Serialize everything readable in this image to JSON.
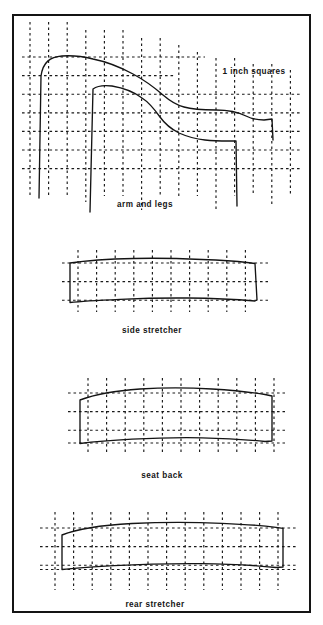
{
  "page": {
    "background_color": "#ffffff",
    "ink_color": "#141414",
    "grid_color": "#1a1a1a",
    "border": {
      "x": 13,
      "y": 15,
      "width": 297,
      "height": 597,
      "stroke_width": 2.0
    },
    "grid_note": "1 inch squares",
    "grid_pitch_px": 18.6
  },
  "figures": [
    {
      "id": "arm-and-legs",
      "caption": "arm and legs",
      "caption_x": 145,
      "caption_y": 205,
      "grid": {
        "x_lines": [
          30,
          48.6,
          67.2,
          85.8,
          104.4,
          123,
          141.6,
          160.2,
          178.8,
          197.4,
          216,
          234.6,
          253.2,
          271.8,
          290.4
        ],
        "y_lines": [
          30,
          48.6,
          67.2,
          85.8,
          104.4,
          123,
          141.6,
          160.2,
          178.8
        ],
        "x_span": [
          22,
          300
        ],
        "y_span": [
          22,
          196
        ]
      },
      "outline_top": "M 39,198 L 41,76 C 43,62 50,57 62,56 C 75,55 85,57 93,59 C 108,62 120,67 133,74 C 146,81 155,88 163,95 C 170,101 176,105 184,107 C 194,110 205,110 216,110 C 228,110 238,112 246,116 C 252,119 258,120 264,120 L 272,119 L 273,140",
      "outline_bottom": "M 90,212 L 93,89 C 97,86 104,85 112,86 C 124,88 134,92 142,98 C 150,103 155,110 160,117 C 165,124 171,129 179,133 C 188,137 196,139 205,140 C 214,141 222,141 229,141 L 236,141 L 237,206"
    },
    {
      "id": "side-stretcher",
      "caption": "side  stretcher",
      "caption_x": 152,
      "caption_y": 331,
      "grid": {
        "x_lines": [
          78,
          96.6,
          115.2,
          133.8,
          152.4,
          171,
          189.6,
          208.2,
          226.8,
          245.4
        ],
        "y_lines": [
          263,
          281.6,
          300.2
        ],
        "x_span": [
          62,
          265
        ],
        "y_span": [
          250,
          312
        ]
      },
      "outline": "M 70,263 C 90,260 112,259 134,258.5 C 156,258 180,258.5 202,259.5 C 220,260.2 234,261 247,262.5 L 255,263.5 L 257,300 L 255,301 C 232,299 210,298.2 188,298 C 165,297.8 142,298.3 120,299.3 C 100,300.2 83,301 70,302.5 Z"
    },
    {
      "id": "seat-back",
      "caption": "seat back",
      "caption_x": 162,
      "caption_y": 476,
      "grid": {
        "x_lines": [
          88,
          106.6,
          125.2,
          143.8,
          162.4,
          181,
          199.6,
          218.2,
          236.8,
          255.4,
          274
        ],
        "y_lines": [
          393,
          411.6,
          430.2
        ],
        "x_span": [
          68,
          285
        ],
        "y_span": [
          378,
          455
        ]
      },
      "outline": "M 80,400 C 96,394 118,390.5 140,389 C 164,387.5 190,387.7 212,389 C 232,390.2 250,392 265,394.5 L 272,396 L 272,441 L 265,441.5 C 246,439.5 225,438.2 202,437.8 C 178,437.4 154,438 132,439.2 C 110,440.4 92,442 80,443.5 Z"
    },
    {
      "id": "rear-stretcher",
      "caption": "rear  stretcher",
      "caption_x": 155,
      "caption_y": 605,
      "grid": {
        "x_lines": [
          55,
          73.6,
          92.2,
          110.8,
          129.4,
          148,
          166.6,
          185.2,
          203.8,
          222.4,
          241,
          259.6,
          278
        ],
        "y_lines": [
          528,
          546.6,
          565.2
        ],
        "x_span": [
          40,
          292
        ],
        "y_span": [
          512,
          590
        ]
      },
      "outline": "M 62,535 C 78,528.5 104,525 132,523.5 C 162,522 196,522.2 222,523.3 C 244,524.2 262,525.5 276,527.3 L 283,528.3 L 283,567 L 276,567.5 C 254,565.2 228,563.8 200,563.6 C 170,563.4 140,564.2 114,565.6 C 90,566.9 72,568.3 62,569.5 Z"
    }
  ]
}
